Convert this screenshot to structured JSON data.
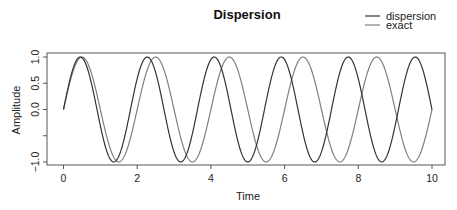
{
  "chart_data": {
    "type": "line",
    "title": "Dispersion",
    "xlabel": "Time",
    "ylabel": "Amplitude",
    "xlim": [
      0,
      10
    ],
    "ylim": [
      -1.0,
      1.0
    ],
    "x_ticks": [
      0,
      2,
      4,
      6,
      8,
      10
    ],
    "x_tick_labels": [
      "0",
      "2",
      "4",
      "6",
      "8",
      "10"
    ],
    "y_ticks": [
      -1.0,
      -0.5,
      0.0,
      0.5,
      1.0
    ],
    "y_tick_labels": [
      "−1.0",
      "",
      "0.0",
      "0.5",
      "1.0"
    ],
    "grid": false,
    "legend_position": "top-right",
    "series": [
      {
        "name": "dispersion",
        "color": "#333333",
        "formula": "sin(1.1*pi*t)",
        "angular_frequency": 3.456,
        "peaks_t": [
          0.45,
          2.27,
          4.09,
          5.91,
          7.73,
          9.55
        ],
        "troughs_t": [
          1.36,
          3.18,
          5.0,
          6.82,
          8.64
        ]
      },
      {
        "name": "exact",
        "color": "#808080",
        "formula": "sin(pi*t)",
        "angular_frequency": 3.1416,
        "peaks_t": [
          0.5,
          2.5,
          4.5,
          6.5,
          8.5
        ],
        "troughs_t": [
          1.5,
          3.5,
          5.5,
          7.5,
          9.5
        ]
      }
    ]
  }
}
